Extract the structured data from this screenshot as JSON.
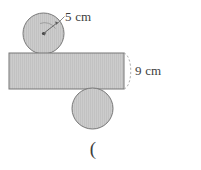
{
  "figure": {
    "name": "geometry-figure-rectangle-with-two-circles",
    "background_color": "#ffffff",
    "shape_fill": "#c9c9c9",
    "shape_stroke": "#6e6e6e",
    "annotation_color": "#3d3d3d",
    "labels": {
      "radius_label": "5 cm",
      "height_label": "9 cm",
      "bottom_label": "("
    },
    "shapes": {
      "top_circle": {
        "name": "top-circle",
        "cx": 43.5,
        "cy": 33.5,
        "r": 20.5
      },
      "rectangle": {
        "name": "rectangle",
        "x": 9,
        "y": 53,
        "width": 115,
        "height": 36
      },
      "bottom_circle": {
        "name": "bottom-circle",
        "cx": 92.5,
        "cy": 108.5,
        "r": 20.5
      }
    },
    "annotations": {
      "radius_arrow": {
        "name": "radius-arrow",
        "from_x": 43.5,
        "from_y": 33.5,
        "to_x": 58,
        "to_y": 22
      },
      "radius_leader": {
        "name": "radius-leader-line",
        "from_x": 56,
        "from_y": 24,
        "to_x": 64,
        "to_y": 16
      },
      "height_brace": {
        "name": "height-brace-arc",
        "x": 124,
        "y_top": 53,
        "y_bottom": 89
      }
    }
  }
}
